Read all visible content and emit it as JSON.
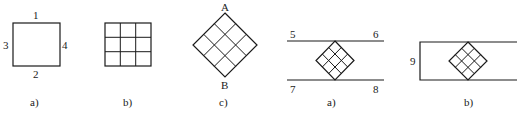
{
  "figure": {
    "panels": [
      {
        "id": "left-a",
        "caption": "a)",
        "description": "Square element with numbered edges",
        "edge_labels": {
          "top": "1",
          "bottom": "2",
          "left": "3",
          "right": "4"
        }
      },
      {
        "id": "left-b",
        "caption": "b)",
        "description": "Square subdivided into 3x3 grid"
      },
      {
        "id": "left-c",
        "caption": "c)",
        "description": "3x3 grid rotated 45 degrees",
        "vertex_labels": {
          "top": "A",
          "bottom": "B"
        }
      },
      {
        "id": "right-a",
        "caption": "a)",
        "description": "Rotated grid between two parallel lines",
        "line_labels": {
          "top_left": "5",
          "top_right": "6",
          "bottom_left": "7",
          "bottom_right": "8"
        }
      },
      {
        "id": "right-b",
        "caption": "b)",
        "description": "Rotated grid inside open rectangle with left edge labeled",
        "edge_labels": {
          "left": "9"
        }
      }
    ]
  }
}
